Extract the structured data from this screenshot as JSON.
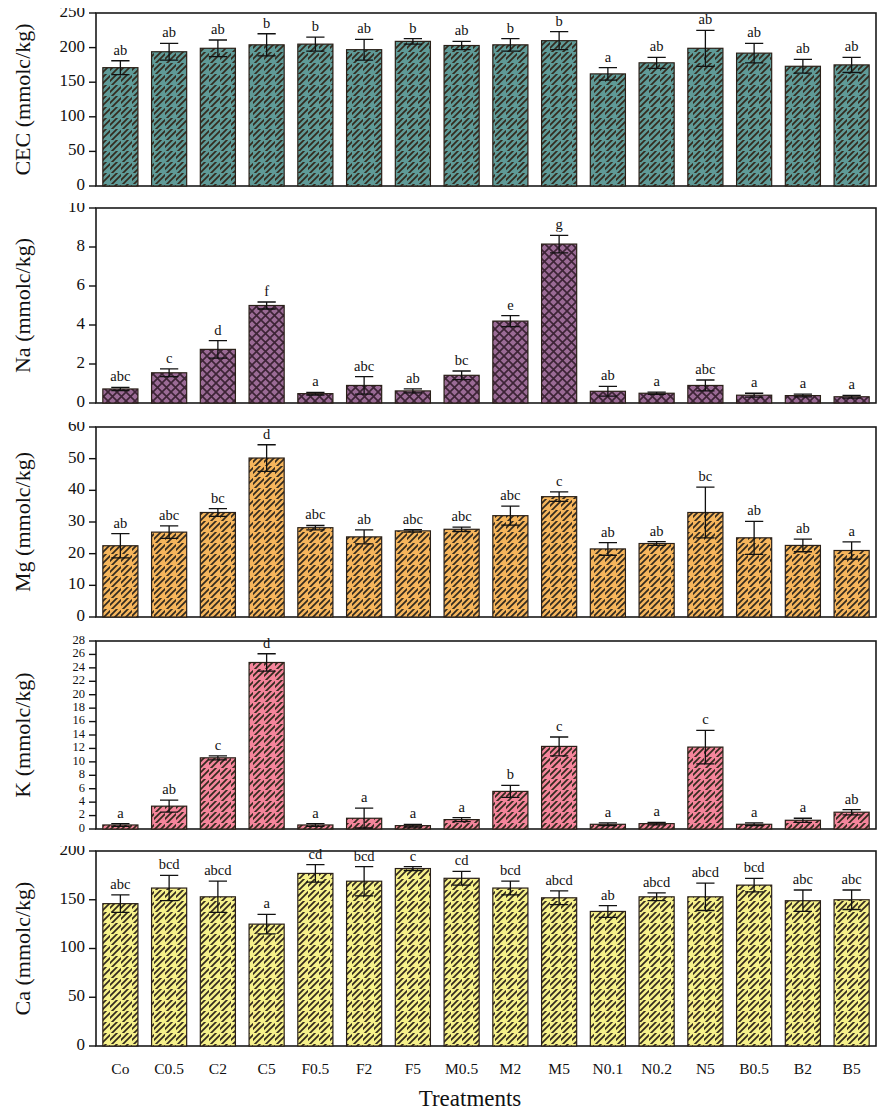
{
  "figure": {
    "xlabel": "Treatments",
    "categories": [
      "Co",
      "C0.5",
      "C2",
      "C5",
      "F0.5",
      "F2",
      "F5",
      "M0.5",
      "M2",
      "M5",
      "N0.1",
      "N0.2",
      "N5",
      "B0.5",
      "B2",
      "B5"
    ]
  },
  "chart_data": [
    {
      "type": "bar",
      "panel": "CEC",
      "title": "",
      "xlabel": "Treatments",
      "ylabel": "CEC (mmolc/kg)",
      "unit": "mmolc/kg",
      "ylim": [
        0,
        250
      ],
      "yticks": [
        0,
        50,
        100,
        150,
        200,
        250
      ],
      "ytick_labels": [
        "0",
        "50",
        "100",
        "150",
        "200",
        "250"
      ],
      "grid": false,
      "legend": "none",
      "bar_color": "#5f9a97",
      "hatch": "diagonal",
      "categories": [
        "Co",
        "C0.5",
        "C2",
        "C5",
        "F0.5",
        "F2",
        "F5",
        "M0.5",
        "M2",
        "M5",
        "N0.1",
        "N0.2",
        "N5",
        "B0.5",
        "B2",
        "B5"
      ],
      "values": [
        171,
        194,
        199,
        204,
        205,
        197,
        209,
        203,
        204,
        210,
        162,
        178,
        199,
        192,
        173,
        175
      ],
      "errors": [
        10,
        12,
        12,
        16,
        10,
        15,
        4,
        6,
        9,
        13,
        9,
        8,
        26,
        14,
        10,
        11
      ],
      "significance": [
        "ab",
        "ab",
        "ab",
        "b",
        "b",
        "ab",
        "b",
        "ab",
        "b",
        "b",
        "a",
        "ab",
        "ab",
        "ab",
        "ab",
        "ab"
      ]
    },
    {
      "type": "bar",
      "panel": "Na",
      "title": "",
      "xlabel": "Treatments",
      "ylabel": "Na (mmolc/kg)",
      "unit": "mmolc/kg",
      "ylim": [
        0,
        10
      ],
      "yticks": [
        0,
        2,
        4,
        6,
        8,
        10
      ],
      "ytick_labels": [
        "0",
        "2",
        "4",
        "6",
        "8",
        "10"
      ],
      "grid": false,
      "legend": "none",
      "bar_color": "#9b6b96",
      "hatch": "cross",
      "categories": [
        "Co",
        "C0.5",
        "C2",
        "C5",
        "F0.5",
        "F2",
        "F5",
        "M0.5",
        "M2",
        "M5",
        "N0.1",
        "N0.2",
        "N5",
        "B0.5",
        "B2",
        "B5"
      ],
      "values": [
        0.72,
        1.55,
        2.75,
        5.0,
        0.48,
        0.9,
        0.62,
        1.42,
        4.2,
        8.15,
        0.6,
        0.5,
        0.9,
        0.4,
        0.38,
        0.32
      ],
      "errors": [
        0.08,
        0.2,
        0.45,
        0.18,
        0.07,
        0.45,
        0.1,
        0.22,
        0.28,
        0.45,
        0.25,
        0.06,
        0.28,
        0.1,
        0.07,
        0.07
      ],
      "significance": [
        "abc",
        "c",
        "d",
        "f",
        "a",
        "abc",
        "ab",
        "bc",
        "e",
        "g",
        "ab",
        "a",
        "abc",
        "a",
        "a",
        "a"
      ]
    },
    {
      "type": "bar",
      "panel": "Mg",
      "title": "",
      "xlabel": "Treatments",
      "ylabel": "Mg (mmolc/kg)",
      "unit": "mmolc/kg",
      "ylim": [
        0,
        60
      ],
      "yticks": [
        0,
        10,
        20,
        30,
        40,
        50,
        60
      ],
      "ytick_labels": [
        "0",
        "10",
        "20",
        "30",
        "40",
        "50",
        "60"
      ],
      "grid": false,
      "legend": "none",
      "bar_color": "#f5b55c",
      "hatch": "diagonal",
      "categories": [
        "Co",
        "C0.5",
        "C2",
        "C5",
        "F0.5",
        "F2",
        "F5",
        "M0.5",
        "M2",
        "M5",
        "N0.1",
        "N0.2",
        "N5",
        "B0.5",
        "B2",
        "B5"
      ],
      "values": [
        22.5,
        26.8,
        33.0,
        50.2,
        28.2,
        25.3,
        27.2,
        27.7,
        32.0,
        38.0,
        21.5,
        23.2,
        33.0,
        25.0,
        22.6,
        21.0
      ],
      "errors": [
        3.8,
        2.0,
        1.2,
        4.2,
        0.7,
        2.2,
        0.4,
        0.7,
        3.0,
        1.5,
        2.0,
        0.6,
        8.0,
        5.2,
        2.0,
        2.7
      ],
      "significance": [
        "ab",
        "abc",
        "bc",
        "d",
        "abc",
        "ab",
        "abc",
        "abc",
        "abc",
        "c",
        "ab",
        "ab",
        "bc",
        "ab",
        "ab",
        "a"
      ]
    },
    {
      "type": "bar",
      "panel": "K",
      "title": "",
      "xlabel": "Treatments",
      "ylabel": "K (mmolc/kg)",
      "unit": "mmolc/kg",
      "ylim": [
        0,
        28
      ],
      "yticks": [
        0,
        2,
        4,
        6,
        8,
        10,
        12,
        14,
        16,
        18,
        20,
        22,
        24,
        26,
        28
      ],
      "ytick_labels": [
        "0",
        "2",
        "4",
        "6",
        "8",
        "10",
        "12",
        "14",
        "16",
        "18",
        "20",
        "22",
        "24",
        "26",
        "28"
      ],
      "grid": false,
      "legend": "none",
      "bar_color": "#f4859b",
      "hatch": "diagonal",
      "categories": [
        "Co",
        "C0.5",
        "C2",
        "C5",
        "F0.5",
        "F2",
        "F5",
        "M0.5",
        "M2",
        "M5",
        "N0.1",
        "N0.2",
        "N5",
        "B0.5",
        "B2",
        "B5"
      ],
      "values": [
        0.6,
        3.4,
        10.6,
        24.8,
        0.6,
        1.6,
        0.5,
        1.4,
        5.6,
        12.3,
        0.7,
        0.8,
        12.2,
        0.7,
        1.3,
        2.5
      ],
      "errors": [
        0.2,
        0.9,
        0.3,
        1.3,
        0.2,
        1.5,
        0.2,
        0.3,
        0.9,
        1.4,
        0.2,
        0.2,
        2.5,
        0.2,
        0.3,
        0.4
      ],
      "significance": [
        "a",
        "ab",
        "c",
        "d",
        "a",
        "a",
        "a",
        "a",
        "b",
        "c",
        "a",
        "a",
        "c",
        "a",
        "a",
        "ab"
      ]
    },
    {
      "type": "bar",
      "panel": "Ca",
      "title": "",
      "xlabel": "Treatments",
      "ylabel": "Ca (mmolc/kg)",
      "unit": "mmolc/kg",
      "ylim": [
        0,
        200
      ],
      "yticks": [
        0,
        50,
        100,
        150,
        200
      ],
      "ytick_labels": [
        "0",
        "50",
        "100",
        "150",
        "200"
      ],
      "grid": false,
      "legend": "none",
      "bar_color": "#f5f08a",
      "hatch": "diagonal",
      "categories": [
        "Co",
        "C0.5",
        "C2",
        "C5",
        "F0.5",
        "F2",
        "F5",
        "M0.5",
        "M2",
        "M5",
        "N0.1",
        "N0.2",
        "N5",
        "B0.5",
        "B2",
        "B5"
      ],
      "values": [
        146,
        162,
        153,
        125,
        177,
        169,
        182,
        172,
        162,
        152,
        138,
        153,
        153,
        165,
        149,
        150
      ],
      "errors": [
        9,
        13,
        16,
        10,
        9,
        15,
        2,
        7,
        7,
        7,
        6,
        4,
        14,
        7,
        11,
        10
      ],
      "significance": [
        "abc",
        "bcd",
        "abcd",
        "a",
        "cd",
        "bcd",
        "c",
        "cd",
        "bcd",
        "abcd",
        "ab",
        "abcd",
        "abcd",
        "bcd",
        "abc",
        "abc"
      ]
    }
  ]
}
